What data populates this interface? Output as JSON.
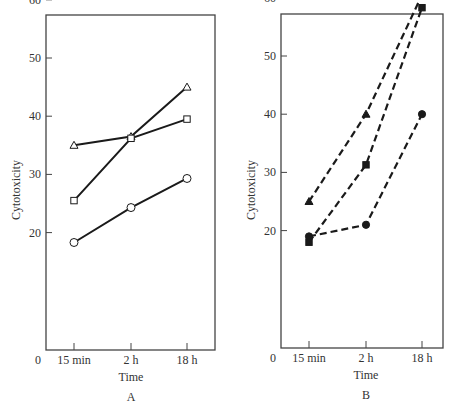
{
  "chart_data": [
    {
      "type": "line",
      "panel_label": "A",
      "title": "",
      "xlabel": "Time",
      "ylabel": "Cytotoxicity",
      "categories": [
        "15 min",
        "2 h",
        "18 h"
      ],
      "origin_label": "0",
      "yticks": [
        20,
        30,
        40,
        50,
        60
      ],
      "ylim": [
        0,
        67
      ],
      "grid": false,
      "line_style": "solid",
      "series": [
        {
          "name": "open triangle",
          "marker": "triangle-open",
          "values": [
            35,
            36.5,
            45
          ]
        },
        {
          "name": "open square",
          "marker": "square-open",
          "values": [
            25.5,
            36.2,
            39.5
          ]
        },
        {
          "name": "open circle",
          "marker": "circle-open",
          "values": [
            18.3,
            24.3,
            29.3
          ]
        }
      ]
    },
    {
      "type": "line",
      "panel_label": "B",
      "title": "",
      "xlabel": "Time",
      "ylabel": "Cytotoxicity",
      "categories": [
        "15 min",
        "2 h",
        "18 h"
      ],
      "origin_label": "0",
      "yticks": [
        20,
        30,
        40,
        50,
        60
      ],
      "ylim": [
        0,
        67
      ],
      "grid": false,
      "line_style": "dashed",
      "series": [
        {
          "name": "filled triangle",
          "marker": "triangle-filled",
          "values": [
            25,
            40,
            60.5
          ]
        },
        {
          "name": "filled square",
          "marker": "square-filled",
          "values": [
            18,
            31.3,
            58.3
          ]
        },
        {
          "name": "filled circle",
          "marker": "circle-filled",
          "values": [
            19,
            21,
            40
          ]
        }
      ]
    }
  ],
  "colors": {
    "ink": "#1a1a1a",
    "axis": "#444444",
    "text": "#333333",
    "background": "#ffffff"
  }
}
